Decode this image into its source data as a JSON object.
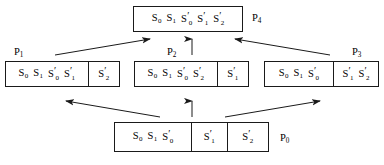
{
  "diagram": {
    "kind": "state-transition-diagram",
    "stroke_color": "#1a1a1a",
    "background_color": "#ffffff",
    "nodes": [
      {
        "id": "P4",
        "label": "P",
        "label_sub": "4",
        "position": "top",
        "cells": [
          {
            "symbols": [
              {
                "base": "S",
                "sub": "0",
                "prime": ""
              },
              {
                "base": "S",
                "sub": "1",
                "prime": ""
              },
              {
                "base": "S",
                "sub": "0",
                "prime": "′"
              },
              {
                "base": "S",
                "sub": "1",
                "prime": "′"
              },
              {
                "base": "S",
                "sub": "2",
                "prime": "′"
              }
            ]
          }
        ]
      },
      {
        "id": "P1",
        "label": "P",
        "label_sub": "1",
        "position": "middle-left",
        "cells": [
          {
            "symbols": [
              {
                "base": "S",
                "sub": "0",
                "prime": ""
              },
              {
                "base": "S",
                "sub": "1",
                "prime": ""
              },
              {
                "base": "S",
                "sub": "0",
                "prime": "′"
              },
              {
                "base": "S",
                "sub": "1",
                "prime": "′"
              }
            ]
          },
          {
            "symbols": [
              {
                "base": "S",
                "sub": "2",
                "prime": "′"
              }
            ]
          }
        ]
      },
      {
        "id": "P2",
        "label": "P",
        "label_sub": "2",
        "position": "middle-center",
        "cells": [
          {
            "symbols": [
              {
                "base": "S",
                "sub": "0",
                "prime": ""
              },
              {
                "base": "S",
                "sub": "1",
                "prime": ""
              },
              {
                "base": "S",
                "sub": "0",
                "prime": "′"
              },
              {
                "base": "S",
                "sub": "2",
                "prime": "′"
              }
            ]
          },
          {
            "symbols": [
              {
                "base": "S",
                "sub": "1",
                "prime": "′"
              }
            ]
          }
        ]
      },
      {
        "id": "P3",
        "label": "P",
        "label_sub": "3",
        "position": "middle-right",
        "cells": [
          {
            "symbols": [
              {
                "base": "S",
                "sub": "0",
                "prime": ""
              },
              {
                "base": "S",
                "sub": "1",
                "prime": ""
              },
              {
                "base": "S",
                "sub": "0",
                "prime": "′"
              }
            ]
          },
          {
            "symbols": [
              {
                "base": "S",
                "sub": "1",
                "prime": "′"
              },
              {
                "base": "S",
                "sub": "2",
                "prime": "′"
              }
            ]
          }
        ]
      },
      {
        "id": "P0",
        "label": "P",
        "label_sub": "0",
        "position": "bottom",
        "cells": [
          {
            "symbols": [
              {
                "base": "S",
                "sub": "0",
                "prime": ""
              },
              {
                "base": "S",
                "sub": "1",
                "prime": ""
              },
              {
                "base": "S",
                "sub": "0",
                "prime": "′"
              }
            ]
          },
          {
            "symbols": [
              {
                "base": "S",
                "sub": "1",
                "prime": "′"
              }
            ]
          },
          {
            "symbols": [
              {
                "base": "S",
                "sub": "2",
                "prime": "′"
              }
            ]
          }
        ]
      }
    ],
    "edges": [
      {
        "from": "P0",
        "to": "P1",
        "direction": "up-left"
      },
      {
        "from": "P0",
        "to": "P2",
        "direction": "up"
      },
      {
        "from": "P0",
        "to": "P3",
        "direction": "up-right"
      },
      {
        "from": "P1",
        "to": "P4",
        "direction": "up-right"
      },
      {
        "from": "P2",
        "to": "P4",
        "direction": "up"
      },
      {
        "from": "P3",
        "to": "P4",
        "direction": "up-left"
      }
    ]
  }
}
